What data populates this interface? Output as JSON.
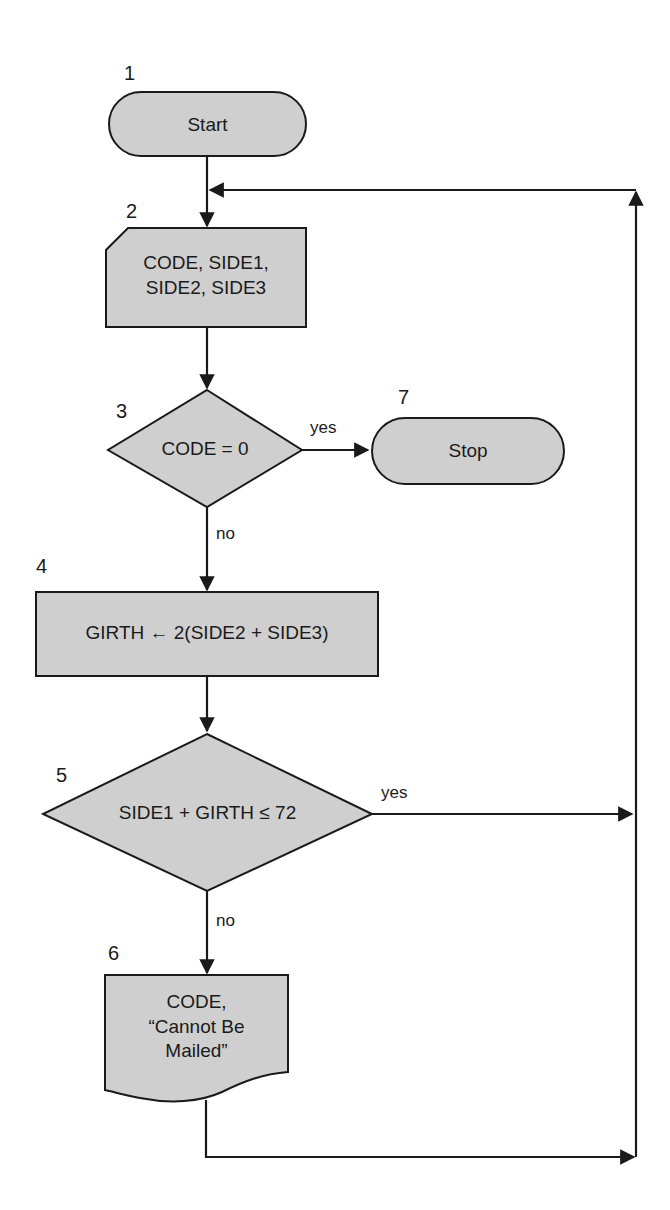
{
  "diagram": {
    "type": "flowchart",
    "nodes": [
      {
        "id": 1,
        "number": "1",
        "shape": "terminal",
        "text": "Start"
      },
      {
        "id": 2,
        "number": "2",
        "shape": "input-card",
        "line1": "CODE, SIDE1,",
        "line2": "SIDE2, SIDE3"
      },
      {
        "id": 3,
        "number": "3",
        "shape": "decision",
        "text": "CODE = 0"
      },
      {
        "id": 4,
        "number": "4",
        "shape": "process",
        "text": "GIRTH ← 2(SIDE2 + SIDE3)"
      },
      {
        "id": 5,
        "number": "5",
        "shape": "decision",
        "text": "SIDE1 + GIRTH ≤ 72"
      },
      {
        "id": 6,
        "number": "6",
        "shape": "document",
        "line1": "CODE,",
        "line2": "“Cannot Be",
        "line3": "Mailed”"
      },
      {
        "id": 7,
        "number": "7",
        "shape": "terminal",
        "text": "Stop"
      }
    ],
    "edge_labels": {
      "d3_yes": "yes",
      "d3_no": "no",
      "d5_yes": "yes",
      "d5_no": "no"
    },
    "colors": {
      "fill": "#cfcfcf",
      "stroke": "#1a1a1a"
    }
  }
}
